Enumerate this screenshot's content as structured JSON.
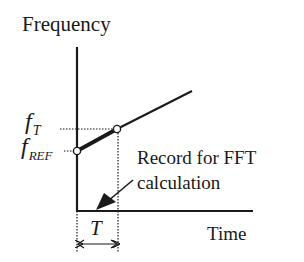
{
  "diagram": {
    "y_axis_label": "Frequency",
    "x_axis_label": "Time",
    "f_t_main": "f",
    "f_t_sub": "T",
    "f_ref_main": "f",
    "f_ref_sub": "REF",
    "interval_label": "T",
    "annotation_line1": "Record for FFT",
    "annotation_line2": "calculation",
    "colors": {
      "ink": "#1a1a1a",
      "background": "#ffffff"
    }
  }
}
